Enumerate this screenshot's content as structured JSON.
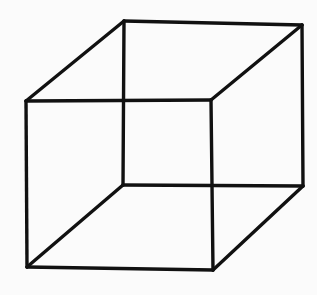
{
  "diagram": {
    "type": "necker-cube-line-drawing",
    "stroke_color": "#111111",
    "background": "#fbfbfb",
    "vertices": {
      "back_top_left": [
        124,
        21
      ],
      "back_top_right": [
        302,
        25
      ],
      "front_top_left": [
        26,
        101
      ],
      "front_top_right": [
        211,
        100
      ],
      "back_bottom_left": [
        123,
        185
      ],
      "back_bottom_right": [
        303,
        186
      ],
      "front_bottom_left": [
        27,
        267
      ],
      "front_bottom_right": [
        213,
        270
      ]
    },
    "edges": [
      [
        "back_top_left",
        "back_top_right"
      ],
      [
        "front_top_left",
        "front_top_right"
      ],
      [
        "back_top_left",
        "front_top_left"
      ],
      [
        "back_top_right",
        "front_top_right"
      ],
      [
        "back_bottom_left",
        "back_bottom_right"
      ],
      [
        "front_bottom_left",
        "front_bottom_right"
      ],
      [
        "back_bottom_left",
        "front_bottom_left"
      ],
      [
        "back_bottom_right",
        "front_bottom_right"
      ],
      [
        "back_top_left",
        "back_bottom_left"
      ],
      [
        "back_top_right",
        "back_bottom_right"
      ],
      [
        "front_top_left",
        "front_bottom_left"
      ],
      [
        "front_top_right",
        "front_bottom_right"
      ]
    ]
  }
}
